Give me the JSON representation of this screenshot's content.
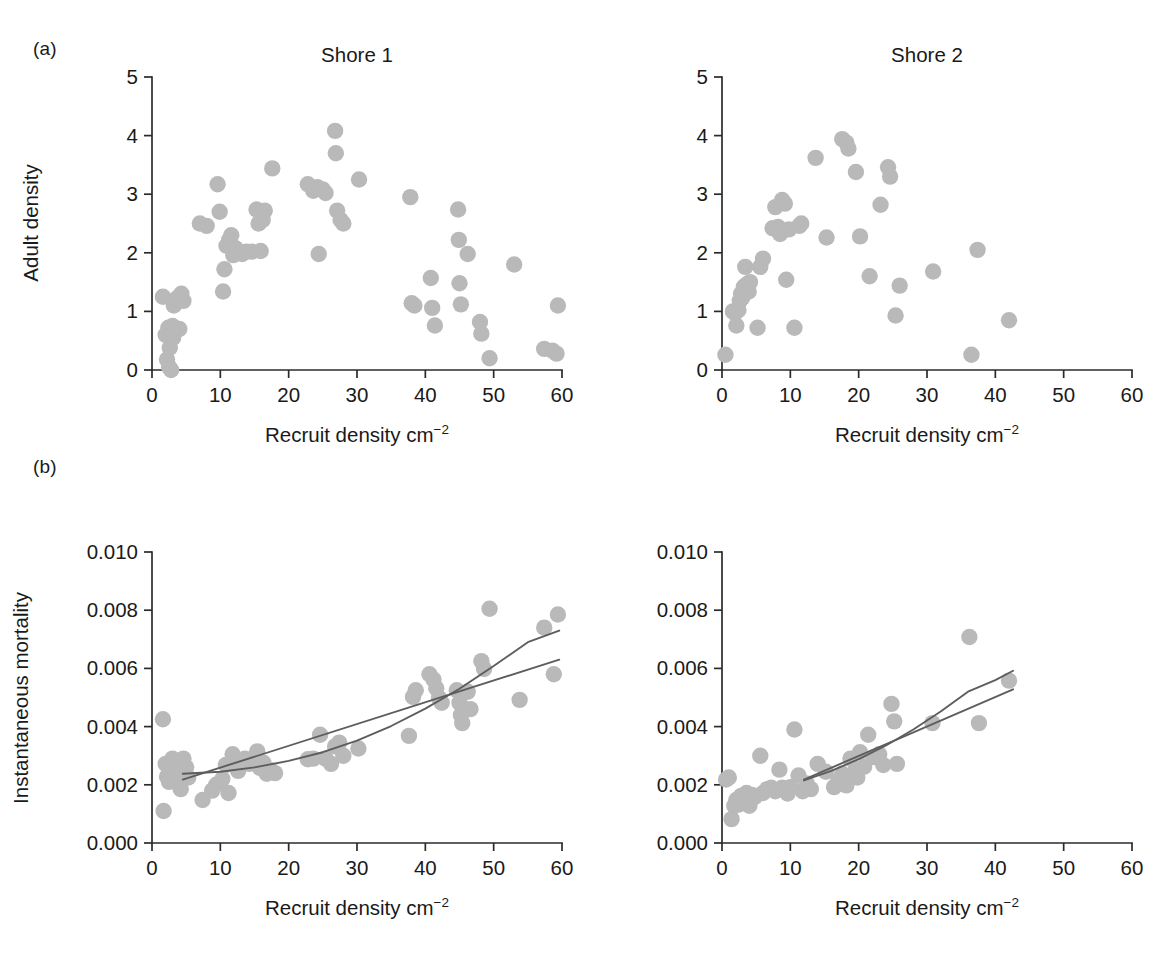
{
  "figure": {
    "panel_labels": {
      "a": "(a)",
      "b": "(b)"
    },
    "caption_fragment": "",
    "marker_color": "#b9b9b9",
    "line_color": "#5d5d5d",
    "axis_color": "#2b2b2b"
  },
  "axis_titles": {
    "x": "Recruit density cm",
    "x_sup": "−2",
    "y_top": "Adult density",
    "y_bottom": "Instantaneous mortality"
  },
  "titles": {
    "shore1": "Shore 1",
    "shore2": "Shore 2"
  },
  "ticks": {
    "x": [
      "0",
      "10",
      "20",
      "30",
      "40",
      "50",
      "60"
    ],
    "y_top": [
      "0",
      "1",
      "2",
      "3",
      "4",
      "5"
    ],
    "y_bottom": [
      "0.000",
      "0.002",
      "0.004",
      "0.006",
      "0.008",
      "0.010"
    ]
  },
  "chart_data": [
    {
      "id": "a-shore1",
      "type": "scatter",
      "title": "Shore 1",
      "panel": "(a)",
      "xlabel": "Recruit density cm−2",
      "ylabel": "Adult density",
      "xlim": [
        0,
        60
      ],
      "ylim": [
        0,
        5
      ],
      "xticks": [
        0,
        10,
        20,
        30,
        40,
        50,
        60
      ],
      "yticks": [
        0,
        1,
        2,
        3,
        4,
        5
      ],
      "grid": false,
      "legend": "none",
      "points": [
        [
          1.6,
          1.25
        ],
        [
          2.0,
          0.6
        ],
        [
          2.2,
          0.18
        ],
        [
          2.4,
          0.72
        ],
        [
          2.5,
          0.05
        ],
        [
          2.6,
          0.38
        ],
        [
          2.8,
          0.0
        ],
        [
          3.0,
          0.75
        ],
        [
          3.1,
          0.55
        ],
        [
          3.2,
          1.1
        ],
        [
          3.4,
          0.68
        ],
        [
          3.6,
          1.22
        ],
        [
          4.0,
          0.7
        ],
        [
          4.3,
          1.3
        ],
        [
          4.6,
          1.18
        ],
        [
          7.0,
          2.5
        ],
        [
          8.0,
          2.46
        ],
        [
          9.6,
          3.17
        ],
        [
          9.9,
          2.7
        ],
        [
          10.4,
          1.34
        ],
        [
          10.6,
          1.72
        ],
        [
          10.9,
          2.12
        ],
        [
          11.3,
          2.22
        ],
        [
          11.6,
          2.3
        ],
        [
          11.9,
          1.96
        ],
        [
          12.2,
          2.08
        ],
        [
          12.6,
          2.02
        ],
        [
          13.2,
          1.98
        ],
        [
          13.8,
          2.02
        ],
        [
          14.6,
          2.02
        ],
        [
          15.3,
          2.74
        ],
        [
          15.6,
          2.5
        ],
        [
          15.9,
          2.03
        ],
        [
          16.2,
          2.56
        ],
        [
          16.5,
          2.72
        ],
        [
          17.6,
          3.44
        ],
        [
          22.8,
          3.17
        ],
        [
          23.6,
          3.06
        ],
        [
          24.2,
          3.12
        ],
        [
          24.4,
          1.98
        ],
        [
          25.0,
          3.08
        ],
        [
          25.4,
          3.02
        ],
        [
          26.8,
          4.08
        ],
        [
          26.9,
          3.7
        ],
        [
          27.1,
          2.72
        ],
        [
          27.6,
          2.56
        ],
        [
          28.0,
          2.5
        ],
        [
          30.3,
          3.25
        ],
        [
          37.8,
          2.95
        ],
        [
          38.0,
          1.14
        ],
        [
          38.4,
          1.1
        ],
        [
          40.8,
          1.57
        ],
        [
          41.0,
          1.06
        ],
        [
          41.4,
          0.76
        ],
        [
          44.8,
          2.74
        ],
        [
          44.9,
          2.22
        ],
        [
          45.0,
          1.48
        ],
        [
          45.2,
          1.12
        ],
        [
          46.2,
          1.98
        ],
        [
          48.0,
          0.82
        ],
        [
          48.2,
          0.62
        ],
        [
          49.4,
          0.2
        ],
        [
          53.0,
          1.8
        ],
        [
          57.4,
          0.36
        ],
        [
          58.6,
          0.33
        ],
        [
          59.2,
          0.28
        ],
        [
          59.4,
          1.1
        ]
      ]
    },
    {
      "id": "a-shore2",
      "type": "scatter",
      "title": "Shore 2",
      "panel": "(a)",
      "xlabel": "Recruit density cm−2",
      "ylabel": "Adult density",
      "xlim": [
        0,
        60
      ],
      "ylim": [
        0,
        5
      ],
      "xticks": [
        0,
        10,
        20,
        30,
        40,
        50,
        60
      ],
      "yticks": [
        0,
        1,
        2,
        3,
        4,
        5
      ],
      "grid": false,
      "legend": "none",
      "points": [
        [
          0.5,
          0.26
        ],
        [
          1.6,
          1.0
        ],
        [
          1.9,
          0.97
        ],
        [
          2.1,
          0.76
        ],
        [
          2.4,
          1.02
        ],
        [
          2.6,
          1.18
        ],
        [
          2.8,
          1.3
        ],
        [
          3.0,
          1.24
        ],
        [
          3.2,
          1.42
        ],
        [
          3.4,
          1.76
        ],
        [
          3.6,
          1.46
        ],
        [
          3.9,
          1.34
        ],
        [
          4.1,
          1.5
        ],
        [
          5.2,
          0.72
        ],
        [
          5.6,
          1.76
        ],
        [
          6.0,
          1.9
        ],
        [
          7.4,
          2.42
        ],
        [
          7.8,
          2.78
        ],
        [
          8.2,
          2.44
        ],
        [
          8.5,
          2.32
        ],
        [
          8.8,
          2.9
        ],
        [
          9.2,
          2.84
        ],
        [
          9.4,
          1.54
        ],
        [
          9.8,
          2.4
        ],
        [
          10.6,
          0.72
        ],
        [
          11.3,
          2.46
        ],
        [
          11.6,
          2.5
        ],
        [
          13.7,
          3.62
        ],
        [
          15.3,
          2.26
        ],
        [
          17.6,
          3.94
        ],
        [
          18.2,
          3.88
        ],
        [
          18.5,
          3.78
        ],
        [
          19.6,
          3.38
        ],
        [
          20.2,
          2.28
        ],
        [
          21.6,
          1.6
        ],
        [
          23.2,
          2.82
        ],
        [
          24.3,
          3.46
        ],
        [
          24.6,
          3.3
        ],
        [
          25.4,
          0.93
        ],
        [
          26.0,
          1.44
        ],
        [
          30.9,
          1.68
        ],
        [
          36.5,
          0.26
        ],
        [
          37.4,
          2.05
        ],
        [
          42.0,
          0.85
        ]
      ]
    },
    {
      "id": "b-shore1",
      "type": "scatter",
      "title": "",
      "panel": "(b)",
      "xlabel": "Recruit density cm−2",
      "ylabel": "Instantaneous mortality",
      "xlim": [
        0,
        60
      ],
      "ylim": [
        0.0,
        0.01
      ],
      "xticks": [
        0,
        10,
        20,
        30,
        40,
        50,
        60
      ],
      "yticks": [
        0.0,
        0.002,
        0.004,
        0.006,
        0.008,
        0.01
      ],
      "grid": false,
      "legend": "none",
      "points": [
        [
          1.6,
          0.00425
        ],
        [
          1.7,
          0.0011
        ],
        [
          2.0,
          0.00272
        ],
        [
          2.2,
          0.00228
        ],
        [
          2.5,
          0.0021
        ],
        [
          2.8,
          0.00245
        ],
        [
          3.0,
          0.0029
        ],
        [
          3.2,
          0.00232
        ],
        [
          3.4,
          0.00215
        ],
        [
          3.6,
          0.00255
        ],
        [
          3.9,
          0.00225
        ],
        [
          4.2,
          0.00185
        ],
        [
          4.6,
          0.0029
        ],
        [
          5.0,
          0.0026
        ],
        [
          5.3,
          0.00225
        ],
        [
          7.4,
          0.00148
        ],
        [
          8.8,
          0.0018
        ],
        [
          9.4,
          0.002
        ],
        [
          10.3,
          0.0022
        ],
        [
          10.8,
          0.00268
        ],
        [
          11.2,
          0.00172
        ],
        [
          11.8,
          0.00305
        ],
        [
          12.2,
          0.00285
        ],
        [
          12.6,
          0.00248
        ],
        [
          13.0,
          0.00276
        ],
        [
          13.6,
          0.0029
        ],
        [
          14.2,
          0.00272
        ],
        [
          15.4,
          0.00315
        ],
        [
          15.8,
          0.00258
        ],
        [
          16.3,
          0.00276
        ],
        [
          16.8,
          0.00238
        ],
        [
          17.4,
          0.0025
        ],
        [
          18.0,
          0.0024
        ],
        [
          22.8,
          0.00288
        ],
        [
          23.6,
          0.0029
        ],
        [
          24.6,
          0.00372
        ],
        [
          25.4,
          0.0029
        ],
        [
          26.2,
          0.00272
        ],
        [
          26.8,
          0.00332
        ],
        [
          27.4,
          0.00345
        ],
        [
          28.0,
          0.003
        ],
        [
          30.2,
          0.00325
        ],
        [
          37.6,
          0.00368
        ],
        [
          38.2,
          0.00502
        ],
        [
          38.6,
          0.00525
        ],
        [
          40.6,
          0.0058
        ],
        [
          41.2,
          0.00562
        ],
        [
          41.6,
          0.00532
        ],
        [
          42.0,
          0.00498
        ],
        [
          42.4,
          0.00482
        ],
        [
          44.6,
          0.00525
        ],
        [
          45.0,
          0.00482
        ],
        [
          45.2,
          0.0044
        ],
        [
          45.4,
          0.00412
        ],
        [
          46.2,
          0.0052
        ],
        [
          46.6,
          0.0046
        ],
        [
          48.2,
          0.00625
        ],
        [
          48.6,
          0.00598
        ],
        [
          49.4,
          0.00805
        ],
        [
          53.8,
          0.00492
        ],
        [
          57.4,
          0.0074
        ],
        [
          58.8,
          0.0058
        ],
        [
          59.4,
          0.00785
        ]
      ],
      "fits": [
        {
          "name": "quadratic-fit",
          "points": [
            [
              4.5,
              0.00238
            ],
            [
              10,
              0.00245
            ],
            [
              15,
              0.0026
            ],
            [
              20,
              0.00282
            ],
            [
              25,
              0.00312
            ],
            [
              30,
              0.00352
            ],
            [
              35,
              0.00402
            ],
            [
              40,
              0.00462
            ],
            [
              45,
              0.0053
            ],
            [
              50,
              0.00608
            ],
            [
              55,
              0.0069
            ],
            [
              59.6,
              0.0073
            ]
          ]
        },
        {
          "name": "linear-fit",
          "points": [
            [
              4.5,
              0.00218
            ],
            [
              59.6,
              0.0063
            ]
          ]
        }
      ]
    },
    {
      "id": "b-shore2",
      "type": "scatter",
      "title": "",
      "panel": "(b)",
      "xlabel": "Recruit density cm−2",
      "ylabel": "Instantaneous mortality",
      "xlim": [
        0,
        60
      ],
      "ylim": [
        0.0,
        0.01
      ],
      "xticks": [
        0,
        10,
        20,
        30,
        40,
        50,
        60
      ],
      "yticks": [
        0.0,
        0.002,
        0.004,
        0.006,
        0.008,
        0.01
      ],
      "grid": false,
      "legend": "none",
      "points": [
        [
          0.6,
          0.00218
        ],
        [
          1.0,
          0.00225
        ],
        [
          1.4,
          0.00082
        ],
        [
          1.8,
          0.00128
        ],
        [
          2.1,
          0.00148
        ],
        [
          2.4,
          0.00132
        ],
        [
          2.8,
          0.00162
        ],
        [
          3.2,
          0.00145
        ],
        [
          3.6,
          0.00172
        ],
        [
          4.0,
          0.00128
        ],
        [
          4.4,
          0.00165
        ],
        [
          4.8,
          0.00158
        ],
        [
          5.6,
          0.003
        ],
        [
          6.0,
          0.00172
        ],
        [
          6.6,
          0.00185
        ],
        [
          7.2,
          0.0019
        ],
        [
          7.8,
          0.00178
        ],
        [
          8.4,
          0.00252
        ],
        [
          8.8,
          0.0019
        ],
        [
          9.2,
          0.00185
        ],
        [
          9.6,
          0.0017
        ],
        [
          10.0,
          0.00192
        ],
        [
          10.6,
          0.0039
        ],
        [
          11.2,
          0.00232
        ],
        [
          11.8,
          0.00178
        ],
        [
          12.4,
          0.00205
        ],
        [
          13.0,
          0.00185
        ],
        [
          14.0,
          0.00272
        ],
        [
          15.2,
          0.00245
        ],
        [
          16.4,
          0.00192
        ],
        [
          17.0,
          0.00215
        ],
        [
          17.6,
          0.00238
        ],
        [
          18.2,
          0.00198
        ],
        [
          18.8,
          0.0029
        ],
        [
          19.4,
          0.00245
        ],
        [
          19.8,
          0.00225
        ],
        [
          20.2,
          0.00312
        ],
        [
          20.8,
          0.00262
        ],
        [
          21.4,
          0.00372
        ],
        [
          22.2,
          0.00295
        ],
        [
          23.0,
          0.00305
        ],
        [
          23.6,
          0.00268
        ],
        [
          24.8,
          0.00478
        ],
        [
          25.2,
          0.00418
        ],
        [
          25.6,
          0.00272
        ],
        [
          30.8,
          0.00412
        ],
        [
          36.2,
          0.00708
        ],
        [
          37.6,
          0.00412
        ],
        [
          42.0,
          0.00558
        ]
      ],
      "fits": [
        {
          "name": "quadratic-fit",
          "points": [
            [
              12,
              0.00215
            ],
            [
              16,
              0.00248
            ],
            [
              20,
              0.00288
            ],
            [
              24,
              0.00335
            ],
            [
              28,
              0.0039
            ],
            [
              32,
              0.00452
            ],
            [
              36,
              0.0052
            ],
            [
              40,
              0.0056
            ],
            [
              42.6,
              0.00592
            ]
          ]
        },
        {
          "name": "linear-fit",
          "points": [
            [
              12,
              0.00218
            ],
            [
              42.6,
              0.00528
            ]
          ]
        }
      ]
    }
  ]
}
